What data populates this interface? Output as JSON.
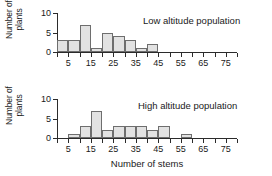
{
  "figure": {
    "xaxis_title": "Number of stems",
    "yaxis_title_line1": "Number of",
    "yaxis_title_line2": "plants"
  },
  "chart_data": [
    {
      "type": "bar",
      "title": "Low altitude population",
      "xlabel": "",
      "ylabel": "Number of plants",
      "bin_width": 5,
      "bin_starts": [
        0,
        5,
        10,
        15,
        20,
        25,
        30,
        35,
        40,
        45,
        50,
        55,
        60,
        65,
        70,
        75
      ],
      "values": [
        3,
        3,
        7,
        1,
        5,
        4,
        3,
        1,
        2,
        0,
        0,
        0,
        0,
        0,
        0,
        0
      ],
      "xtick_values": [
        5,
        15,
        25,
        35,
        45,
        55,
        65,
        75
      ],
      "xtick_labels": [
        "5",
        "15",
        "25",
        "35",
        "45",
        "55",
        "65",
        "75"
      ],
      "ytick_values": [
        0,
        5,
        10
      ],
      "ytick_labels": [
        "0",
        "5",
        "10"
      ],
      "xlim": [
        0,
        80
      ],
      "ylim": [
        0,
        10
      ],
      "grid": false,
      "legend": "none",
      "bar_fill": "#e2e2e2",
      "bar_stroke": "#6e6e6e"
    },
    {
      "type": "bar",
      "title": "High altitude population",
      "xlabel": "Number of stems",
      "ylabel": "Number of plants",
      "bin_width": 5,
      "bin_starts": [
        0,
        5,
        10,
        15,
        20,
        25,
        30,
        35,
        40,
        45,
        50,
        55,
        60,
        65,
        70,
        75
      ],
      "values": [
        0,
        1,
        3,
        7,
        2,
        3,
        3,
        3,
        2,
        3,
        0,
        1,
        0,
        0,
        0,
        0
      ],
      "xtick_values": [
        5,
        15,
        25,
        35,
        45,
        55,
        65,
        75
      ],
      "xtick_labels": [
        "5",
        "15",
        "25",
        "35",
        "45",
        "55",
        "65",
        "75"
      ],
      "ytick_values": [
        0,
        5,
        10
      ],
      "ytick_labels": [
        "0",
        "5",
        "10"
      ],
      "xlim": [
        0,
        80
      ],
      "ylim": [
        0,
        10
      ],
      "grid": false,
      "legend": "none",
      "bar_fill": "#e2e2e2",
      "bar_stroke": "#6e6e6e"
    }
  ]
}
